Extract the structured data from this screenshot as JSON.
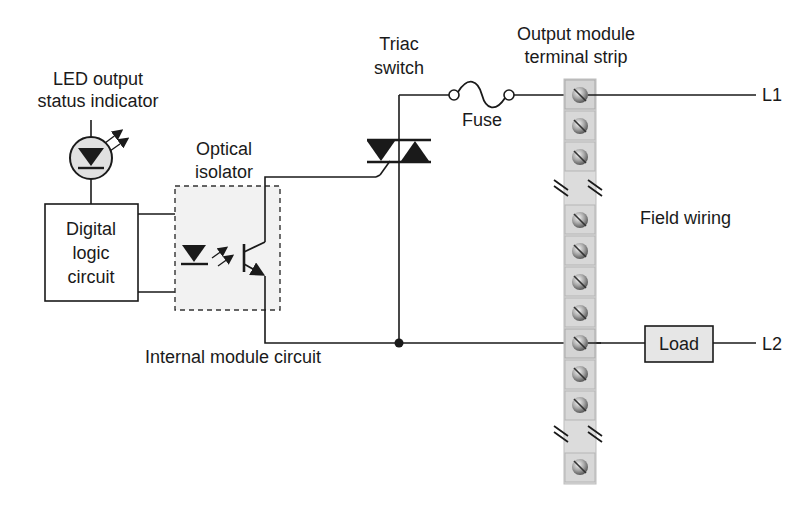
{
  "diagram": {
    "labels": {
      "led_indicator_line1": "LED output",
      "led_indicator_line2": "status indicator",
      "digital_logic_line1": "Digital",
      "digital_logic_line2": "logic",
      "digital_logic_line3": "circuit",
      "optical_isolator_line1": "Optical",
      "optical_isolator_line2": "isolator",
      "triac_line1": "Triac",
      "triac_line2": "switch",
      "fuse": "Fuse",
      "terminal_strip_line1": "Output module",
      "terminal_strip_line2": "terminal strip",
      "field_wiring": "Field wiring",
      "internal_module_circuit": "Internal module circuit",
      "load": "Load",
      "l1": "L1",
      "l2": "L2"
    },
    "terminal_strip": {
      "terminal_count_upper": 3,
      "terminal_count_middle": 5,
      "terminal_count_lower": 3,
      "break_marks": 2
    },
    "colors": {
      "line": "#1a1a1a",
      "box_fill_gray": "#e6e6e6",
      "isolator_fill": "#f2f2f2",
      "strip_fill": "#dcdcdc",
      "screw_fill": "#8a8a8a"
    }
  }
}
